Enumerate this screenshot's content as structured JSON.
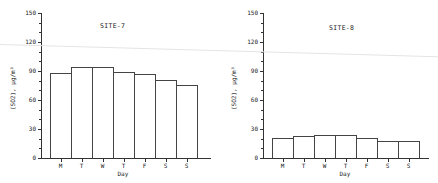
{
  "chart_data": [
    {
      "type": "bar",
      "title": "SITE-7",
      "xlabel": "Day",
      "ylabel": "(SO2), µg/m³",
      "categories": [
        "M",
        "T",
        "W",
        "T",
        "F",
        "S",
        "S"
      ],
      "values": [
        88,
        94,
        94,
        89,
        87,
        81,
        76
      ],
      "ylim": [
        0,
        150
      ],
      "yticks": [
        0,
        30,
        60,
        90,
        120,
        150
      ],
      "grid": false,
      "legend": null
    },
    {
      "type": "bar",
      "title": "SITE-8",
      "xlabel": "Day",
      "ylabel": "(SO2), µg/m³",
      "categories": [
        "M",
        "T",
        "W",
        "T",
        "F",
        "S",
        "S"
      ],
      "values": [
        21,
        23,
        24,
        24,
        21,
        18,
        18
      ],
      "ylim": [
        0,
        150
      ],
      "yticks": [
        0,
        30,
        60,
        90,
        120,
        150
      ],
      "grid": false,
      "legend": null
    }
  ]
}
